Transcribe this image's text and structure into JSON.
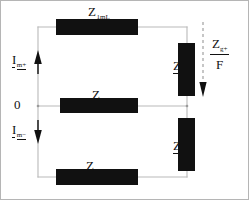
{
  "diagram": {
    "background_color": "#ffffff",
    "wire_color": "#bfbfbf",
    "block_color": "#111111",
    "text_color": "#111111",
    "border_color": "#b0b0b0"
  },
  "labels": {
    "z1ml_top": {
      "base": "Z",
      "sub": "1mL"
    },
    "zal_mid": {
      "base": "Z",
      "sub": "aL"
    },
    "z1ml_bottom": {
      "base": "Z",
      "sub": "1mL"
    },
    "z_plus": {
      "base": "Z",
      "sub": "+"
    },
    "z_minus": {
      "base": "Z",
      "sub": "−"
    },
    "im_plus": {
      "base": "I",
      "sub": "m+"
    },
    "im_minus": {
      "base": "I",
      "sub": "m−"
    },
    "node_zero": {
      "base": "0"
    },
    "zg_over_f": {
      "numerator": "Z",
      "numerator_sub": "g+",
      "denominator": "F"
    }
  },
  "elements": {
    "impedance_block_top": {
      "name": "Z1mL top branch impedance"
    },
    "impedance_block_middle": {
      "name": "ZaL middle branch impedance"
    },
    "impedance_block_bottom": {
      "name": "Z1mL bottom branch impedance"
    },
    "impedance_block_right_upper": {
      "name": "Z+ positive sequence impedance"
    },
    "impedance_block_right_lower": {
      "name": "Z- negative sequence impedance"
    },
    "current_arrow_up": {
      "name": "Im+ current direction arrow, pointing up"
    },
    "current_arrow_down": {
      "name": "Im- current direction arrow, pointing down"
    },
    "dashed_arrow": {
      "name": "Zg+/F source arrow, dashed, pointing down"
    }
  }
}
